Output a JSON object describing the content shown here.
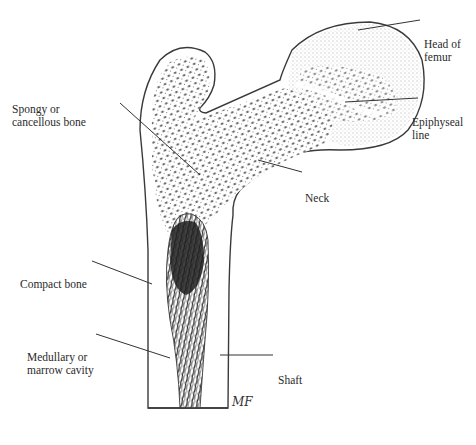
{
  "diagram": {
    "signature": "MF",
    "colors": {
      "outline": "#3a3a3a",
      "stipple": "#222222",
      "leader": "#333333",
      "background": "#ffffff"
    },
    "labels": [
      {
        "id": "head-of-femur",
        "line1": "Head of",
        "line2": "femur"
      },
      {
        "id": "spongy-bone",
        "line1": "Spongy or",
        "line2": "cancellous bone"
      },
      {
        "id": "epiphyseal-line",
        "line1": "Epiphyseal",
        "line2": "line"
      },
      {
        "id": "neck",
        "line1": "Neck",
        "line2": ""
      },
      {
        "id": "compact-bone",
        "line1": "Compact bone",
        "line2": ""
      },
      {
        "id": "medullary-cavity",
        "line1": "Medullary or",
        "line2": "marrow cavity"
      },
      {
        "id": "shaft",
        "line1": "Shaft",
        "line2": ""
      }
    ]
  }
}
